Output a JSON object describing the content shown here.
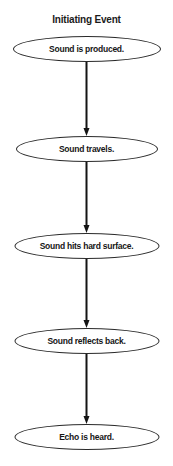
{
  "diagram": {
    "title": "Initiating Event",
    "type": "flowchart",
    "orientation": "vertical",
    "node_shape": "ellipse",
    "colors": {
      "background": "#ffffff",
      "node_fill": "#ffffff",
      "node_stroke": "#2a2a2a",
      "text": "#161616",
      "arrow": "#141414"
    },
    "nodes": [
      {
        "id": "node-1",
        "label": "Sound is produced.",
        "center_y": 49,
        "width": 148,
        "height": 26
      },
      {
        "id": "node-2",
        "label": "Sound travels.",
        "center_y": 149,
        "width": 142,
        "height": 26
      },
      {
        "id": "node-3",
        "label": "Sound hits hard surface.",
        "center_y": 246,
        "width": 145,
        "height": 26
      },
      {
        "id": "node-4",
        "label": "Sound reflects back.",
        "center_y": 341,
        "width": 145,
        "height": 26
      },
      {
        "id": "node-5",
        "label": "Echo is heard.",
        "center_y": 437,
        "width": 145,
        "height": 26
      }
    ],
    "arrows": [
      {
        "id": "arrow-1",
        "from": "node-1",
        "to": "node-2",
        "top": 62,
        "height": 74
      },
      {
        "id": "arrow-2",
        "from": "node-2",
        "to": "node-3",
        "top": 162,
        "height": 71
      },
      {
        "id": "arrow-3",
        "from": "node-3",
        "to": "node-4",
        "top": 259,
        "height": 69
      },
      {
        "id": "arrow-4",
        "from": "node-4",
        "to": "node-5",
        "top": 354,
        "height": 70
      }
    ]
  }
}
